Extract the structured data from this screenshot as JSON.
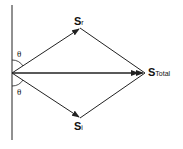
{
  "diagram": {
    "labels": {
      "reflected": {
        "main": "S",
        "sub": "r"
      },
      "incident": {
        "main": "S",
        "sub": "i"
      },
      "total": {
        "main": "S",
        "sub": "Total"
      }
    },
    "angles": {
      "top": "θ",
      "bottom": "θ"
    },
    "colors": {
      "stroke": "#222222",
      "background": "#ffffff"
    }
  }
}
